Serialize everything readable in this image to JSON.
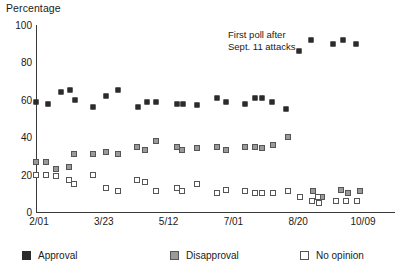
{
  "chart_data": {
    "type": "scatter",
    "title": "",
    "ylabel": "Percentage",
    "xlabel": "",
    "ylim": [
      0,
      100
    ],
    "yticks": [
      0,
      20,
      40,
      60,
      80,
      100
    ],
    "xticks": [
      "2/01",
      "3/23",
      "5/12",
      "7/01",
      "8/20",
      "10/09"
    ],
    "xlim": [
      0,
      33
    ],
    "grid": false,
    "legend_position": "bottom",
    "annotations": [
      {
        "text_line1": "First poll after",
        "text_line2": "Sept. 11 attacks",
        "points_to_x": 24.2,
        "points_to_y": 86
      }
    ],
    "series": [
      {
        "name": "Approval",
        "color": "#2b2b2b",
        "marker": "filled-square",
        "points": [
          {
            "x": 0.0,
            "y": 59
          },
          {
            "x": 1.1,
            "y": 58
          },
          {
            "x": 2.3,
            "y": 64
          },
          {
            "x": 3.1,
            "y": 65
          },
          {
            "x": 3.6,
            "y": 60
          },
          {
            "x": 5.2,
            "y": 56
          },
          {
            "x": 6.4,
            "y": 62
          },
          {
            "x": 7.5,
            "y": 65
          },
          {
            "x": 9.4,
            "y": 56
          },
          {
            "x": 10.2,
            "y": 59
          },
          {
            "x": 11.0,
            "y": 59
          },
          {
            "x": 13.0,
            "y": 58
          },
          {
            "x": 13.5,
            "y": 58
          },
          {
            "x": 14.8,
            "y": 57
          },
          {
            "x": 16.6,
            "y": 61
          },
          {
            "x": 17.5,
            "y": 59
          },
          {
            "x": 19.2,
            "y": 58
          },
          {
            "x": 20.1,
            "y": 61
          },
          {
            "x": 20.8,
            "y": 61
          },
          {
            "x": 21.7,
            "y": 59
          },
          {
            "x": 23.0,
            "y": 55
          },
          {
            "x": 24.2,
            "y": 86
          },
          {
            "x": 25.3,
            "y": 92
          },
          {
            "x": 27.3,
            "y": 90
          },
          {
            "x": 28.2,
            "y": 92
          },
          {
            "x": 29.4,
            "y": 90
          }
        ]
      },
      {
        "name": "Disapproval",
        "color": "#9a9a9a",
        "marker": "gray-square",
        "points": [
          {
            "x": 0.0,
            "y": 27
          },
          {
            "x": 0.9,
            "y": 27
          },
          {
            "x": 1.8,
            "y": 23
          },
          {
            "x": 3.0,
            "y": 24
          },
          {
            "x": 3.5,
            "y": 31
          },
          {
            "x": 5.2,
            "y": 31
          },
          {
            "x": 6.4,
            "y": 32
          },
          {
            "x": 7.5,
            "y": 31
          },
          {
            "x": 9.3,
            "y": 35
          },
          {
            "x": 10.0,
            "y": 33
          },
          {
            "x": 11.0,
            "y": 38
          },
          {
            "x": 13.0,
            "y": 35
          },
          {
            "x": 13.4,
            "y": 33
          },
          {
            "x": 14.8,
            "y": 34
          },
          {
            "x": 16.6,
            "y": 35
          },
          {
            "x": 17.5,
            "y": 33
          },
          {
            "x": 19.2,
            "y": 35
          },
          {
            "x": 20.1,
            "y": 35
          },
          {
            "x": 20.8,
            "y": 34
          },
          {
            "x": 21.8,
            "y": 36
          },
          {
            "x": 23.2,
            "y": 40
          },
          {
            "x": 25.5,
            "y": 11
          },
          {
            "x": 26.3,
            "y": 8
          },
          {
            "x": 28.0,
            "y": 12
          },
          {
            "x": 28.7,
            "y": 10
          },
          {
            "x": 29.8,
            "y": 11
          }
        ]
      },
      {
        "name": "No opinion",
        "color": "#ffffff",
        "marker": "open-square",
        "points": [
          {
            "x": 0.0,
            "y": 20
          },
          {
            "x": 0.9,
            "y": 20
          },
          {
            "x": 1.8,
            "y": 19
          },
          {
            "x": 3.0,
            "y": 17
          },
          {
            "x": 3.5,
            "y": 15
          },
          {
            "x": 5.2,
            "y": 20
          },
          {
            "x": 6.4,
            "y": 13
          },
          {
            "x": 7.5,
            "y": 11
          },
          {
            "x": 9.3,
            "y": 17
          },
          {
            "x": 10.0,
            "y": 16
          },
          {
            "x": 11.0,
            "y": 11
          },
          {
            "x": 13.0,
            "y": 13
          },
          {
            "x": 13.4,
            "y": 11
          },
          {
            "x": 14.8,
            "y": 15
          },
          {
            "x": 16.6,
            "y": 10
          },
          {
            "x": 17.5,
            "y": 12
          },
          {
            "x": 19.2,
            "y": 11
          },
          {
            "x": 20.1,
            "y": 10
          },
          {
            "x": 20.8,
            "y": 10
          },
          {
            "x": 21.8,
            "y": 10
          },
          {
            "x": 23.2,
            "y": 11
          },
          {
            "x": 24.3,
            "y": 8
          },
          {
            "x": 25.4,
            "y": 6
          },
          {
            "x": 25.9,
            "y": 8
          },
          {
            "x": 26.0,
            "y": 5
          },
          {
            "x": 27.6,
            "y": 6
          },
          {
            "x": 28.5,
            "y": 6
          },
          {
            "x": 29.5,
            "y": 6
          }
        ]
      }
    ]
  }
}
